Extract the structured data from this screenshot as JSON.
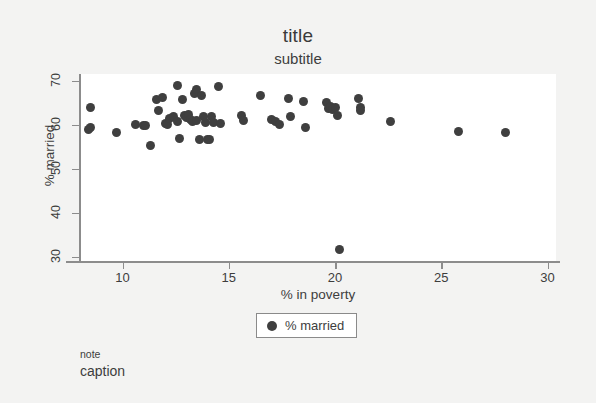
{
  "figure": {
    "background_color": "#f3f3f2",
    "plot_background_color": "#ffffff",
    "axis_color": "#8c8c8c",
    "text_color": "#3d3d3d"
  },
  "note": "note",
  "caption": "caption",
  "legend": {
    "position": "below-x-axis-centered",
    "marker_icon": "filled-circle-marker",
    "entries": [
      {
        "label": "% married",
        "color": "#3f3f3f",
        "marker": "circle"
      }
    ]
  },
  "chart_data": {
    "type": "scatter",
    "title": "title",
    "subtitle": "subtitle",
    "xlabel": "% in poverty",
    "ylabel": "% married",
    "xlim": [
      8.0,
      30.4
    ],
    "ylim": [
      29.0,
      71.5
    ],
    "xticks": [
      10,
      15,
      20,
      25,
      30
    ],
    "yticks": [
      30,
      40,
      50,
      60,
      70
    ],
    "grid": false,
    "marker_color": "#3f3f3f",
    "marker_size_px": 9,
    "series": [
      {
        "name": "% married",
        "color": "#3f3f3f",
        "points": [
          [
            8.5,
            64.0
          ],
          [
            8.5,
            59.3
          ],
          [
            8.4,
            58.9
          ],
          [
            9.7,
            58.2
          ],
          [
            10.6,
            60.0
          ],
          [
            11.0,
            59.9
          ],
          [
            11.1,
            59.8
          ],
          [
            11.3,
            55.3
          ],
          [
            11.6,
            65.6
          ],
          [
            11.7,
            63.1
          ],
          [
            11.9,
            66.1
          ],
          [
            12.0,
            60.3
          ],
          [
            12.1,
            60.1
          ],
          [
            12.2,
            61.5
          ],
          [
            12.4,
            61.9
          ],
          [
            12.6,
            68.8
          ],
          [
            12.6,
            60.6
          ],
          [
            12.7,
            56.8
          ],
          [
            12.8,
            65.6
          ],
          [
            12.9,
            62.0
          ],
          [
            13.0,
            61.7
          ],
          [
            13.1,
            62.4
          ],
          [
            13.2,
            61.2
          ],
          [
            13.3,
            60.6
          ],
          [
            13.4,
            67.1
          ],
          [
            13.5,
            68.0
          ],
          [
            13.5,
            61.0
          ],
          [
            13.6,
            56.7
          ],
          [
            13.7,
            66.6
          ],
          [
            13.8,
            61.8
          ],
          [
            13.9,
            60.5
          ],
          [
            14.0,
            56.6
          ],
          [
            14.1,
            56.6
          ],
          [
            14.2,
            61.9
          ],
          [
            14.3,
            60.4
          ],
          [
            14.5,
            68.7
          ],
          [
            14.6,
            60.3
          ],
          [
            15.6,
            62.0
          ],
          [
            15.7,
            61.0
          ],
          [
            16.5,
            66.6
          ],
          [
            17.0,
            61.2
          ],
          [
            17.2,
            60.6
          ],
          [
            17.4,
            60.0
          ],
          [
            17.8,
            66.0
          ],
          [
            17.9,
            61.9
          ],
          [
            18.5,
            65.2
          ],
          [
            18.6,
            59.3
          ],
          [
            19.6,
            65.0
          ],
          [
            19.7,
            63.6
          ],
          [
            19.8,
            64.2
          ],
          [
            19.9,
            63.4
          ],
          [
            20.0,
            64.0
          ],
          [
            20.1,
            62.0
          ],
          [
            20.2,
            31.7
          ],
          [
            21.1,
            66.0
          ],
          [
            21.2,
            63.8
          ],
          [
            21.2,
            63.2
          ],
          [
            22.6,
            60.8
          ],
          [
            25.8,
            58.4
          ],
          [
            28.0,
            58.2
          ]
        ]
      }
    ]
  }
}
